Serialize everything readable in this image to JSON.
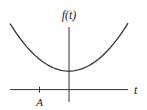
{
  "chart_data": {
    "type": "line",
    "title": "",
    "xlabel": "t",
    "ylabel": "f(t)",
    "xlim": [
      -3.1,
      3.1
    ],
    "ylim": [
      -0.5,
      2.6
    ],
    "x_ticks": [
      {
        "value": -1.55,
        "label": "A"
      }
    ],
    "grid": false,
    "legend": "none",
    "series": [
      {
        "name": "f(t)",
        "description": "upward-opening parabola with minimum slightly left of t=0, above the t-axis",
        "x": [
          -3.1,
          -2.5,
          -2.0,
          -1.5,
          -1.0,
          -0.5,
          -0.1,
          0.5,
          1.0,
          1.5,
          2.0,
          2.5,
          3.1
        ],
        "values": [
          2.6,
          2.02,
          1.6,
          1.25,
          0.96,
          0.74,
          0.65,
          0.73,
          0.95,
          1.25,
          1.62,
          2.05,
          2.6
        ]
      }
    ]
  }
}
